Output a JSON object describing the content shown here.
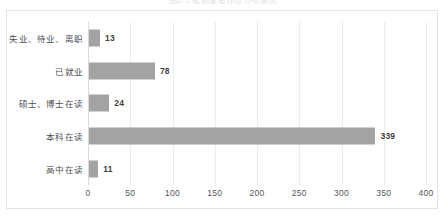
{
  "top_caption": "图2-1  被调查者身份分布情况",
  "chart_data": {
    "type": "bar",
    "orientation": "horizontal",
    "title": "",
    "xlabel": "",
    "ylabel": "",
    "xlim": [
      0,
      400
    ],
    "xticks": [
      0,
      50,
      100,
      150,
      200,
      250,
      300,
      350,
      400
    ],
    "xtick_labels": [
      "0",
      "50",
      "100",
      "150",
      "200",
      "250",
      "300",
      "350",
      "400"
    ],
    "grid": true,
    "legend": "none",
    "bar_color": "#a3a3a3",
    "categories": [
      "失业、待业、离职",
      "已就业",
      "硕士、博士在读",
      "本科在读",
      "高中在读"
    ],
    "values": [
      13,
      78,
      24,
      339,
      11
    ],
    "value_labels": [
      "13",
      "78",
      "24",
      "339",
      "11"
    ],
    "bars": [
      {
        "category": "失业、待业、离职",
        "value": 13,
        "label": "13"
      },
      {
        "category": "已就业",
        "value": 78,
        "label": "78"
      },
      {
        "category": "硕士、博士在读",
        "value": 24,
        "label": "24"
      },
      {
        "category": "本科在读",
        "value": 339,
        "label": "339"
      },
      {
        "category": "高中在读",
        "value": 11,
        "label": "11"
      }
    ]
  }
}
